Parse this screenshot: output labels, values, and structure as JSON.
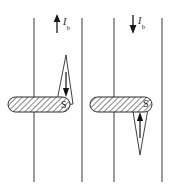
{
  "figure": {
    "background_color": "#ffffff",
    "line_color": "#3a3a3a",
    "ink_color": "#1a1a1a",
    "hatch_color": "#555555",
    "panels": [
      {
        "name": "left-panel",
        "current_label": "I",
        "current_subscript": "b",
        "current_direction": "up",
        "current_arrow_x": 57,
        "current_arrow_top": 15,
        "current_arrow_bottom": 33,
        "wires": [
          {
            "x": 34,
            "y1": 18,
            "y2": 182
          },
          {
            "x": 82,
            "y1": 18,
            "y2": 182
          }
        ],
        "bar": {
          "x": 8,
          "y": 97,
          "width": 62,
          "height": 15,
          "pole_label": "S",
          "pole_label_x": 61,
          "pole_label_y": 100
        },
        "needle": {
          "apex_x": 66,
          "apex_y": 55,
          "base_left_x": 56,
          "base_left_y": 106,
          "base_right_x": 73,
          "base_right_y": 104,
          "orientation": "point-up",
          "inner_arrow_direction": "down",
          "inner_arrow_x": 66,
          "inner_arrow_y1": 72,
          "inner_arrow_y2": 97
        }
      },
      {
        "name": "right-panel",
        "current_label": "I",
        "current_subscript": "b",
        "current_direction": "down",
        "current_arrow_x": 133,
        "current_arrow_top": 15,
        "current_arrow_bottom": 33,
        "wires": [
          {
            "x": 114,
            "y1": 18,
            "y2": 182
          },
          {
            "x": 162,
            "y1": 18,
            "y2": 182
          }
        ],
        "bar": {
          "x": 90,
          "y": 97,
          "width": 62,
          "height": 15,
          "pole_label": "S",
          "pole_label_x": 143,
          "pole_label_y": 99
        },
        "needle": {
          "apex_x": 140,
          "apex_y": 155,
          "base_left_x": 132,
          "base_left_y": 105,
          "base_right_x": 149,
          "base_right_y": 103,
          "orientation": "point-down",
          "inner_arrow_direction": "up",
          "inner_arrow_x": 140,
          "inner_arrow_y1": 138,
          "inner_arrow_y2": 112
        }
      }
    ]
  }
}
